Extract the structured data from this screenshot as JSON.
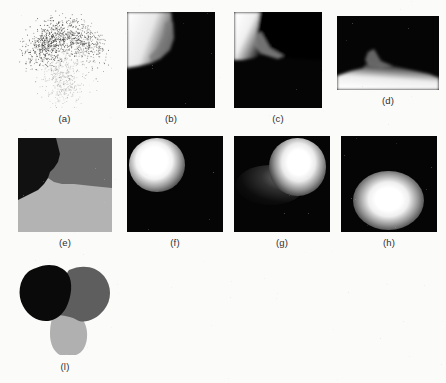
{
  "figure": {
    "background_color": "#fbfbfa",
    "label_color": "#2e2e2e",
    "panel_count": 9,
    "rows": 3
  },
  "palette": {
    "black": "#000000",
    "cluster_dark": "#0a0a0a",
    "cluster_mid": "#5e5e5e",
    "cluster_light": "#b0b0b0",
    "seg_black": "#111111",
    "seg_mid_gray": "#6b6b6b",
    "seg_light_gray": "#b3b3b3",
    "white": "#ffffff",
    "scatter_point": "#3a3a3a"
  },
  "panels": [
    {
      "id": "a",
      "label": "(a)",
      "kind": "scatter",
      "description": "three-lobed point cloud",
      "x": 17,
      "y": 10,
      "w": 95,
      "h": 98
    },
    {
      "id": "b",
      "label": "(b)",
      "kind": "density-map",
      "description": "black field with white upper-left region and gray wedge",
      "x": 127,
      "y": 12,
      "w": 88,
      "h": 96
    },
    {
      "id": "c",
      "label": "(c)",
      "kind": "density-map",
      "description": "black field with white upper-left block and gray diagonal wedge",
      "x": 234,
      "y": 12,
      "w": 88,
      "h": 96
    },
    {
      "id": "d",
      "label": "(d)",
      "kind": "density-map",
      "description": "wide black field with white curved lower region and gray wedge",
      "x": 337,
      "y": 16,
      "w": 102,
      "h": 74
    },
    {
      "id": "e",
      "label": "(e)",
      "kind": "segmentation",
      "description": "three-region segmentation: black upper-left, mid-gray upper-right, light-gray bottom",
      "x": 18,
      "y": 138,
      "w": 94,
      "h": 94
    },
    {
      "id": "f",
      "label": "(f)",
      "kind": "blob",
      "description": "bright blob upper-left on black",
      "x": 127,
      "y": 136,
      "w": 96,
      "h": 96
    },
    {
      "id": "g",
      "label": "(g)",
      "kind": "blob",
      "description": "bright blob upper-right with faint tail toward lower-left",
      "x": 234,
      "y": 136,
      "w": 96,
      "h": 96
    },
    {
      "id": "h",
      "label": "(h)",
      "kind": "blob",
      "description": "bright blob lower-center on black",
      "x": 341,
      "y": 136,
      "w": 96,
      "h": 96
    },
    {
      "id": "i",
      "label": "(l)",
      "kind": "clustering",
      "description": "final three-cluster segmentation of the lobed shape",
      "x": 14,
      "y": 258,
      "w": 102,
      "h": 98
    }
  ]
}
